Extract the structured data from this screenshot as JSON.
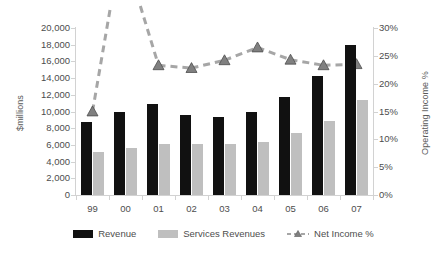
{
  "chart_data": {
    "type": "bar",
    "title": "",
    "xlabel": "",
    "ylabel": "$millions",
    "y2label": "Operating Income %",
    "categories": [
      "99",
      "00",
      "01",
      "02",
      "03",
      "04",
      "05",
      "06",
      "07"
    ],
    "ylim": [
      0,
      20000
    ],
    "y2lim": [
      0,
      0.3
    ],
    "grid": false,
    "legend_position": "bottom",
    "y_ticks": [
      "0",
      "2,000",
      "4,000",
      "6,000",
      "8,000",
      "10,000",
      "12,000",
      "14,000",
      "16,000",
      "18,000",
      "20,000"
    ],
    "y_tick_values": [
      0,
      2000,
      4000,
      6000,
      8000,
      10000,
      12000,
      14000,
      16000,
      18000,
      20000
    ],
    "y2_ticks": [
      "0%",
      "5%",
      "10%",
      "15%",
      "20%",
      "25%",
      "30%"
    ],
    "y2_tick_values": [
      0,
      5,
      10,
      15,
      20,
      25,
      30
    ],
    "series": [
      {
        "name": "Revenue",
        "kind": "bar",
        "axis": "left",
        "color": "#111111",
        "values": [
          8700,
          10000,
          10900,
          9600,
          9400,
          10000,
          11700,
          14300,
          18000
        ]
      },
      {
        "name": "Services Revenues",
        "kind": "bar",
        "axis": "left",
        "color": "#bfbfbf",
        "values": [
          5100,
          5600,
          6100,
          6100,
          6100,
          6400,
          7400,
          8900,
          11400
        ]
      },
      {
        "name": "Net Income %",
        "kind": "line",
        "axis": "right",
        "color": "#a6a6a6",
        "marker": "triangle",
        "marker_color": "#808080",
        "dashed": true,
        "values": [
          15.0,
          null,
          23.3,
          22.8,
          24.2,
          26.5,
          24.3,
          23.3,
          23.5
        ]
      }
    ]
  },
  "legend": {
    "items": [
      {
        "label": "Revenue",
        "swatch": "bar-dark"
      },
      {
        "label": "Services Revenues",
        "swatch": "bar-gray"
      },
      {
        "label": "Net Income %",
        "swatch": "dashed-line-triangle"
      }
    ]
  },
  "colors": {
    "revenue": "#111111",
    "services": "#bfbfbf",
    "net_income_line": "#a6a6a6",
    "net_income_marker": "#808080",
    "axis": "#d2d2d2",
    "text": "#4d4d4d",
    "background": "#ffffff"
  }
}
